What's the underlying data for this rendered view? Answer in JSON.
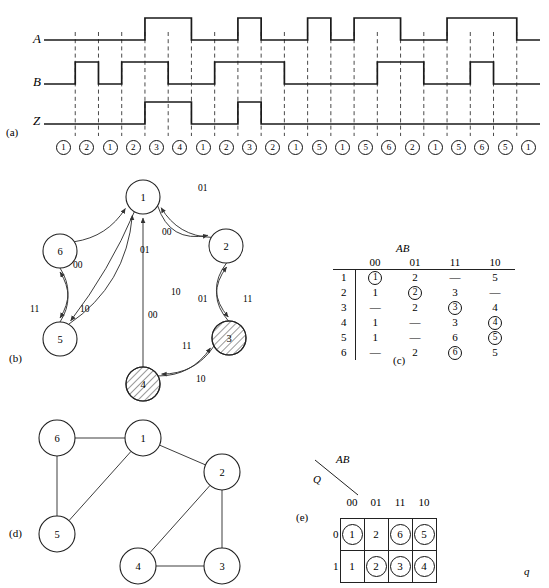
{
  "figure": {
    "parts": [
      {
        "tag": "(a)",
        "kind": "timing-diagram"
      },
      {
        "tag": "(b)",
        "kind": "state-diagram"
      },
      {
        "tag": "(c)",
        "kind": "flow-table"
      },
      {
        "tag": "(d)",
        "kind": "merger-graph"
      },
      {
        "tag": "(e)",
        "kind": "reduced-flow-table"
      }
    ]
  },
  "timing": {
    "signals": [
      "A",
      "B",
      "Z"
    ],
    "states": [
      "1",
      "2",
      "1",
      "2",
      "3",
      "4",
      "1",
      "2",
      "3",
      "2",
      "1",
      "5",
      "1",
      "5",
      "6",
      "2",
      "1",
      "5",
      "6",
      "5",
      "1"
    ],
    "A_levels": [
      0,
      0,
      0,
      0,
      1,
      1,
      0,
      0,
      1,
      0,
      0,
      1,
      0,
      1,
      1,
      0,
      0,
      1,
      1,
      1,
      0
    ],
    "B_levels": [
      0,
      1,
      0,
      1,
      1,
      0,
      0,
      1,
      1,
      1,
      0,
      0,
      0,
      0,
      1,
      1,
      0,
      0,
      1,
      0,
      0
    ],
    "Z_levels": [
      0,
      0,
      0,
      0,
      1,
      1,
      0,
      0,
      1,
      0,
      0,
      0,
      0,
      0,
      0,
      0,
      0,
      0,
      0,
      0,
      0
    ]
  },
  "state_diagram": {
    "nodes": [
      {
        "id": "1",
        "x": 143,
        "y": 197,
        "r": 17,
        "hatched": false
      },
      {
        "id": "2",
        "x": 226,
        "y": 246,
        "r": 17,
        "hatched": false
      },
      {
        "id": "3",
        "x": 229,
        "y": 338,
        "r": 17,
        "hatched": true
      },
      {
        "id": "4",
        "x": 143,
        "y": 384,
        "r": 17,
        "hatched": true
      },
      {
        "id": "5",
        "x": 60,
        "y": 339,
        "r": 17,
        "hatched": false
      },
      {
        "id": "6",
        "x": 60,
        "y": 251,
        "r": 17,
        "hatched": false
      }
    ],
    "edge_labels": [
      {
        "from": "1",
        "to": "2",
        "label": "01"
      },
      {
        "from": "2",
        "to": "1",
        "label": "00"
      },
      {
        "from": "6",
        "to": "1",
        "label": "01"
      },
      {
        "from": "5",
        "to": "1",
        "label": "00"
      },
      {
        "from": "1",
        "to": "5",
        "label": "10"
      },
      {
        "from": "4",
        "to": "1",
        "label": "00"
      },
      {
        "from": "2",
        "to": "3",
        "label": "11"
      },
      {
        "from": "3",
        "to": "2",
        "label": "01"
      },
      {
        "from": "4",
        "to": "3",
        "label": "11"
      },
      {
        "from": "3",
        "to": "4",
        "label": "10"
      },
      {
        "from": "5",
        "to": "6",
        "label": "11"
      },
      {
        "from": "6",
        "to": "5",
        "label": "10"
      }
    ]
  },
  "flow_table": {
    "input_header": "AB",
    "columns": [
      "00",
      "01",
      "11",
      "10"
    ],
    "row_labels": [
      "1",
      "2",
      "3",
      "4",
      "5",
      "6"
    ],
    "cells": [
      [
        {
          "v": "1",
          "c": true
        },
        {
          "v": "2",
          "c": false
        },
        {
          "v": "—",
          "c": false
        },
        {
          "v": "5",
          "c": false
        }
      ],
      [
        {
          "v": "1",
          "c": false
        },
        {
          "v": "2",
          "c": true
        },
        {
          "v": "3",
          "c": false
        },
        {
          "v": "—",
          "c": false
        }
      ],
      [
        {
          "v": "—",
          "c": false
        },
        {
          "v": "2",
          "c": false
        },
        {
          "v": "3",
          "c": true
        },
        {
          "v": "4",
          "c": false
        }
      ],
      [
        {
          "v": "1",
          "c": false
        },
        {
          "v": "—",
          "c": false
        },
        {
          "v": "3",
          "c": false
        },
        {
          "v": "4",
          "c": true
        }
      ],
      [
        {
          "v": "1",
          "c": false
        },
        {
          "v": "—",
          "c": false
        },
        {
          "v": "6",
          "c": false
        },
        {
          "v": "5",
          "c": true
        }
      ],
      [
        {
          "v": "—",
          "c": false
        },
        {
          "v": "2",
          "c": false
        },
        {
          "v": "6",
          "c": true
        },
        {
          "v": "5",
          "c": false
        }
      ]
    ]
  },
  "merger_graph": {
    "nodes": [
      {
        "id": "6",
        "x": 57,
        "y": 438,
        "r": 18
      },
      {
        "id": "1",
        "x": 143,
        "y": 438,
        "r": 18
      },
      {
        "id": "2",
        "x": 222,
        "y": 472,
        "r": 18
      },
      {
        "id": "5",
        "x": 57,
        "y": 534,
        "r": 18
      },
      {
        "id": "4",
        "x": 138,
        "y": 566,
        "r": 18
      },
      {
        "id": "3",
        "x": 222,
        "y": 566,
        "r": 18
      }
    ],
    "edges": [
      [
        "6",
        "1"
      ],
      [
        "6",
        "5"
      ],
      [
        "1",
        "5"
      ],
      [
        "1",
        "2"
      ],
      [
        "2",
        "4"
      ],
      [
        "2",
        "3"
      ],
      [
        "4",
        "3"
      ]
    ]
  },
  "reduced_table": {
    "input_header": "AB",
    "row_header": "Q",
    "output_header": "q",
    "columns": [
      "00",
      "01",
      "11",
      "10"
    ],
    "row_labels": [
      "0",
      "1"
    ],
    "cells": [
      [
        {
          "v": "1",
          "c": true
        },
        {
          "v": "2",
          "c": false
        },
        {
          "v": "6",
          "c": true
        },
        {
          "v": "5",
          "c": true
        }
      ],
      [
        {
          "v": "1",
          "c": false
        },
        {
          "v": "2",
          "c": true
        },
        {
          "v": "3",
          "c": true
        },
        {
          "v": "4",
          "c": true
        }
      ]
    ]
  }
}
